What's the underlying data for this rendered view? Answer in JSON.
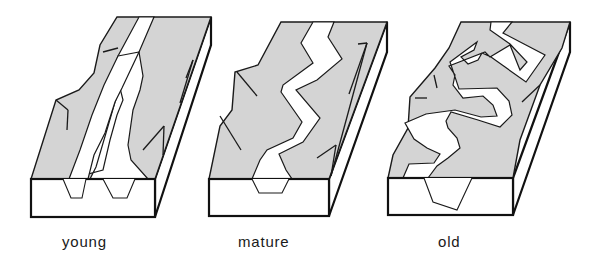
{
  "diagram": {
    "colors": {
      "land": "#d4d4d4",
      "river": "#ffffff",
      "outline": "#1a1a1a"
    },
    "stages": [
      {
        "label": "young",
        "description": "Two narrow V-shaped channels cutting steeply into upland"
      },
      {
        "label": "mature",
        "description": "Single zig-zag river with broader valley"
      },
      {
        "label": "old",
        "description": "Wide meandering river on flat floodplain"
      }
    ]
  }
}
